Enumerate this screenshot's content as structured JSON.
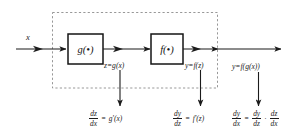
{
  "diagram": {
    "background_color": "#ffffff",
    "line_color": "#1b1b1b",
    "dashed_group_color": "#8c8c8c",
    "box_border_color": "#141414"
  },
  "signals": {
    "input_label": "x",
    "intermediate_label": "z=g(x)",
    "block2_output_label": "y=f(z)",
    "final_output_label": "y=f(g(x))"
  },
  "blocks": [
    {
      "name": "g-block",
      "label": "g(•)"
    },
    {
      "name": "f-block",
      "label": "f(•)"
    }
  ],
  "derivatives": {
    "dz_dx": {
      "lhs_num": "dz",
      "lhs_den": "dx",
      "equals": "=",
      "rhs": "g′(x)"
    },
    "dy_dz": {
      "lhs_num": "dy",
      "lhs_den": "dz",
      "equals": "=",
      "rhs": "f′(z)"
    },
    "dy_dx": {
      "lhs_num": "dy",
      "lhs_den": "dx",
      "equals": "=",
      "term1_num": "dy",
      "term1_den": "dz",
      "dot": "·",
      "term2_num": "dz",
      "term2_den": "dx"
    }
  }
}
